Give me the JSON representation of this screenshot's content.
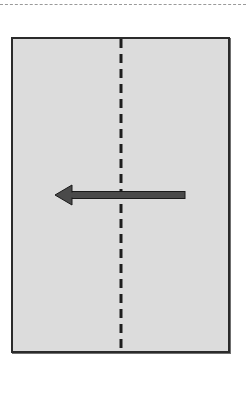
{
  "diagram": {
    "type": "paper-fold-instruction",
    "colors": {
      "paper_fill": "#dcdcdc",
      "paper_border": "#2b2b2b",
      "fold_line": "#1e1e1e",
      "arrow": "#4a4a4a",
      "arrow_outline": "#1a1a1a",
      "top_separator": "#9a9a9a"
    },
    "elements": {
      "sheet": {
        "x": 11,
        "y": 37,
        "width": 219,
        "height": 316
      },
      "fold_line": {
        "x": 121,
        "y1": 39,
        "y2": 350,
        "style": "dashed"
      },
      "arrow": {
        "from_x": 185,
        "to_x": 55,
        "y": 195,
        "direction": "left"
      }
    }
  }
}
